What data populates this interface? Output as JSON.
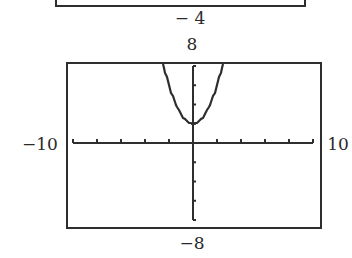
{
  "top_window": {
    "ymin_label": "− 4"
  },
  "main_window": {
    "ymax_label": "8",
    "ymin_label": "−8",
    "xmin_label": "−10",
    "xmax_label": "10"
  },
  "chart_data": {
    "type": "line",
    "title": "",
    "xlabel": "",
    "ylabel": "",
    "function": "y = x^2 + 2",
    "xlim": [
      -10,
      10
    ],
    "ylim": [
      -8,
      8
    ],
    "xscale": 1,
    "yscale": 2,
    "grid": false,
    "x": [
      -2.5,
      -2,
      -1.5,
      -1,
      -0.5,
      0,
      0.5,
      1,
      1.5,
      2,
      2.5
    ],
    "series": [
      {
        "name": "y = x^2 + 2",
        "values": [
          8.25,
          6,
          4.25,
          3,
          2.25,
          2,
          2.25,
          3,
          4.25,
          6,
          8.25
        ]
      }
    ],
    "tick_labels": {
      "x": [
        "−10",
        "10"
      ],
      "y": [
        "−8",
        "8"
      ]
    },
    "partial_previous_window": {
      "ymin_label": "− 4"
    }
  },
  "colors": {
    "ink": "#2e2e2e",
    "background": "#ffffff"
  }
}
